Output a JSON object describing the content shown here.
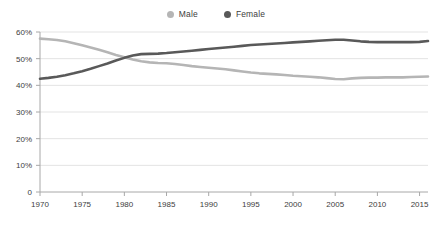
{
  "chart_data": {
    "type": "line",
    "title": "",
    "subtitle": "",
    "xlabel": "",
    "ylabel": "",
    "xlim": [
      1970,
      2016
    ],
    "ylim": [
      0,
      60
    ],
    "grid": true,
    "legend_position": "top-center",
    "y_tick_labels": [
      "60%",
      "50%",
      "40%",
      "30%",
      "20%",
      "10%",
      "0"
    ],
    "y_ticks": [
      60,
      50,
      40,
      30,
      20,
      10,
      0
    ],
    "x_tick_labels": [
      "1970",
      "1975",
      "1980",
      "1985",
      "1990",
      "1995",
      "2000",
      "2005",
      "2010",
      "2015"
    ],
    "x_ticks": [
      1970,
      1975,
      1980,
      1985,
      1990,
      1995,
      2000,
      2005,
      2010,
      2015
    ],
    "x": [
      1970,
      1971,
      1972,
      1973,
      1974,
      1975,
      1976,
      1977,
      1978,
      1979,
      1980,
      1981,
      1982,
      1983,
      1984,
      1985,
      1986,
      1987,
      1988,
      1989,
      1990,
      1991,
      1992,
      1993,
      1994,
      1995,
      1996,
      1997,
      1998,
      1999,
      2000,
      2001,
      2002,
      2003,
      2004,
      2005,
      2006,
      2007,
      2008,
      2009,
      2010,
      2011,
      2012,
      2013,
      2014,
      2015,
      2016
    ],
    "series": [
      {
        "name": "Male",
        "color": "#b5b5b5",
        "values": [
          57.5,
          57.3,
          57.0,
          56.5,
          55.8,
          55.0,
          54.2,
          53.3,
          52.4,
          51.4,
          50.5,
          49.7,
          49.0,
          48.6,
          48.4,
          48.3,
          48.0,
          47.6,
          47.2,
          46.9,
          46.6,
          46.3,
          46.0,
          45.6,
          45.2,
          44.8,
          44.5,
          44.3,
          44.1,
          43.9,
          43.6,
          43.4,
          43.2,
          43.0,
          42.7,
          42.4,
          42.3,
          42.6,
          42.8,
          42.9,
          42.9,
          43.0,
          43.0,
          43.0,
          43.1,
          43.2,
          43.3
        ]
      },
      {
        "name": "Female",
        "color": "#595959",
        "values": [
          42.5,
          42.8,
          43.2,
          43.8,
          44.5,
          45.3,
          46.2,
          47.2,
          48.2,
          49.3,
          50.3,
          51.2,
          51.7,
          51.8,
          51.9,
          52.1,
          52.4,
          52.7,
          53.0,
          53.3,
          53.6,
          53.9,
          54.2,
          54.5,
          54.8,
          55.1,
          55.3,
          55.5,
          55.7,
          55.9,
          56.1,
          56.3,
          56.5,
          56.7,
          56.9,
          57.1,
          57.1,
          56.8,
          56.5,
          56.3,
          56.2,
          56.2,
          56.2,
          56.2,
          56.2,
          56.3,
          56.6
        ]
      }
    ]
  },
  "legend": {
    "items": [
      {
        "label": "Male",
        "color": "#b5b5b5"
      },
      {
        "label": "Female",
        "color": "#595959"
      }
    ]
  },
  "colors": {
    "male": "#b5b5b5",
    "female": "#595959",
    "grid": "#e3e3e3",
    "axis": "#a8a8a8",
    "text": "#3d3d3d",
    "background": "#ffffff"
  }
}
